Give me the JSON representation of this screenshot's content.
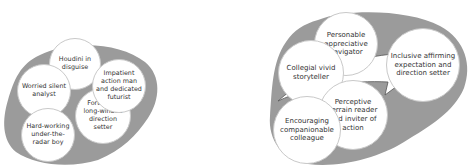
{
  "colors": {
    "blob_fill": "#9b9b9b",
    "circle_fill": "#ffffff",
    "arrow_stroke": "#555555",
    "text": "#333333"
  },
  "left_group": {
    "circles": [
      {
        "label": "Houdini in disguise"
      },
      {
        "label": "Impatient action man and dedicated futurist"
      },
      {
        "label": "Worried silent analyst"
      },
      {
        "label": "Forthright long-winded direction setter"
      },
      {
        "label": "Hard-working under-the-radar boy"
      }
    ]
  },
  "right_group": {
    "circles": [
      {
        "label": "Personable appreciative navigator"
      },
      {
        "label": "Inclusive affirming expectation and direction setter"
      },
      {
        "label": "Collegial vivid storyteller"
      },
      {
        "label": "Perceptive terrain reader and inviter of action"
      },
      {
        "label": "Encouraging companionable colleague"
      }
    ]
  },
  "connector": {
    "type": "curved-arrow",
    "direction": "left-to-right"
  }
}
